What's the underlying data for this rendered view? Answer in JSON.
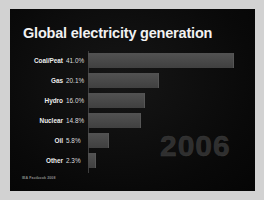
{
  "slide": {
    "title": "Global electricity generation",
    "watermark": "2006",
    "source_credit": "IEA Factbook 2008",
    "background_color": "#0a0a0a",
    "title_color": "#f2f2f2",
    "bar_color": "#4b4b4b",
    "watermark_color": "#2f2f2f",
    "frame_color": "#d2d2d2"
  },
  "chart_data": {
    "type": "bar",
    "orientation": "horizontal",
    "title": "Global electricity generation",
    "xlabel": "",
    "ylabel": "",
    "grid": false,
    "legend": "none",
    "xlim": [
      0,
      45
    ],
    "categories": [
      "Coal/Peat",
      "Gas",
      "Hydro",
      "Nuclear",
      "Oil",
      "Other"
    ],
    "values": [
      41.0,
      20.1,
      16.0,
      14.8,
      5.8,
      2.3
    ],
    "value_labels": [
      "41.0%",
      "20.1%",
      "16.0%",
      "14.8%",
      "5.8%",
      "2.3%"
    ],
    "unit": "%",
    "annotations": [
      "2006"
    ]
  }
}
